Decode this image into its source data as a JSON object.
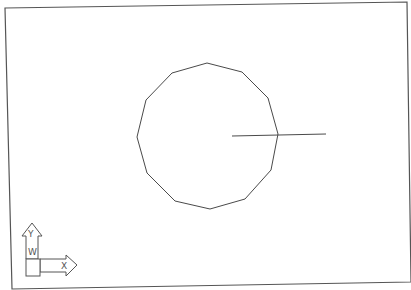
{
  "drawing": {
    "type": "cad-viewport",
    "background": "#ffffff",
    "line_color": "#4a4a4a",
    "frame": {
      "points": [
        [
          5,
          8
        ],
        [
          407,
          2
        ],
        [
          411,
          282
        ],
        [
          12,
          289
        ]
      ]
    },
    "polygon": {
      "sides": 12,
      "vertices": [
        [
          207,
          63
        ],
        [
          242,
          72
        ],
        [
          268,
          98
        ],
        [
          278,
          134
        ],
        [
          271,
          170
        ],
        [
          245,
          199
        ],
        [
          210,
          209
        ],
        [
          175,
          201
        ],
        [
          147,
          173
        ],
        [
          137,
          137
        ],
        [
          146,
          100
        ],
        [
          172,
          73
        ]
      ]
    },
    "line": {
      "x1": 232,
      "y1": 136,
      "x2": 326,
      "y2": 134
    }
  },
  "ucs_icon": {
    "y_label": "Y",
    "w_label": "W",
    "x_label": "X"
  }
}
